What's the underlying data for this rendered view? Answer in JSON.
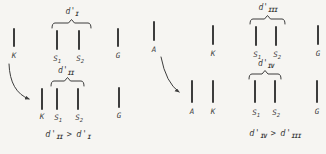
{
  "colors": {
    "background": "#f6f5f2",
    "ink": "#3d3d3d"
  },
  "panels": [
    {
      "name": "left",
      "top": {
        "dprime": {
          "base": "d'",
          "sub": "I"
        },
        "bars": [
          {
            "base": "K",
            "sub": ""
          },
          {
            "base": "S",
            "sub": "1"
          },
          {
            "base": "S",
            "sub": "2"
          },
          {
            "base": "G",
            "sub": ""
          }
        ]
      },
      "bottom": {
        "dprime": {
          "base": "d'",
          "sub": "II"
        },
        "bars": [
          {
            "base": "K",
            "sub": ""
          },
          {
            "base": "S",
            "sub": "1"
          },
          {
            "base": "S",
            "sub": "2"
          },
          {
            "base": "G",
            "sub": ""
          }
        ]
      },
      "conclusion": {
        "lhs_base": "d'",
        "lhs_sub": "II",
        "op": ">",
        "rhs_base": "d'",
        "rhs_sub": "I"
      }
    },
    {
      "name": "right",
      "top": {
        "dprime": {
          "base": "d'",
          "sub": "III"
        },
        "bars": [
          {
            "base": "A",
            "sub": ""
          },
          {
            "base": "K",
            "sub": ""
          },
          {
            "base": "S",
            "sub": "1"
          },
          {
            "base": "S",
            "sub": "2"
          },
          {
            "base": "G",
            "sub": ""
          }
        ]
      },
      "bottom": {
        "dprime": {
          "base": "d'",
          "sub": "IV"
        },
        "bars": [
          {
            "base": "A",
            "sub": ""
          },
          {
            "base": "K",
            "sub": ""
          },
          {
            "base": "S",
            "sub": "1"
          },
          {
            "base": "S",
            "sub": "2"
          },
          {
            "base": "G",
            "sub": ""
          }
        ]
      },
      "conclusion": {
        "lhs_base": "d'",
        "lhs_sub": "IV",
        "op": ">",
        "rhs_base": "d'",
        "rhs_sub": "III"
      }
    }
  ]
}
